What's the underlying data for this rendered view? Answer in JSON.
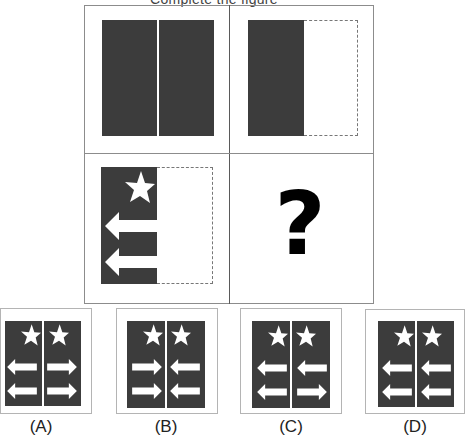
{
  "title_partial": "Complete the figure",
  "puzzle": {
    "cells": [
      {
        "id": "cell-1",
        "description": "two dark halves separated by white line"
      },
      {
        "id": "cell-2",
        "description": "left dark half, right half dashed outline empty"
      },
      {
        "id": "cell-3",
        "description": "left dark half with star and two left arrows, right half dashed outline empty"
      },
      {
        "id": "cell-4",
        "description": "question mark",
        "symbol": "?"
      }
    ]
  },
  "options": [
    {
      "label": "(A)",
      "left_arrows": [
        "left",
        "left"
      ],
      "right_arrows": [
        "right",
        "right"
      ]
    },
    {
      "label": "(B)",
      "left_arrows": [
        "right",
        "right"
      ],
      "right_arrows": [
        "left",
        "left"
      ]
    },
    {
      "label": "(C)",
      "left_arrows": [
        "left",
        "left"
      ],
      "right_arrows": [
        "left",
        "right"
      ]
    },
    {
      "label": "(D)",
      "left_arrows": [
        "left",
        "left"
      ],
      "right_arrows": [
        "left",
        "left"
      ]
    }
  ],
  "colors": {
    "panel_dark": "#3c3c3c",
    "border": "#8c8c8c",
    "shape_fill": "#ffffff"
  }
}
